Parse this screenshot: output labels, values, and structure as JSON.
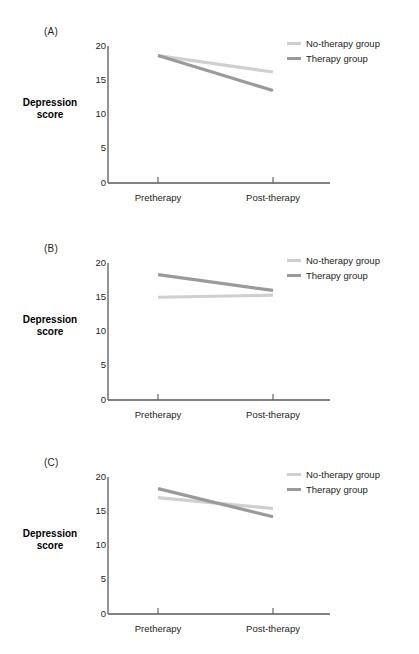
{
  "figure": {
    "series_colors": {
      "no_therapy": "#cfcfcf",
      "therapy": "#9a9a9a"
    },
    "axis_color": "#58595b",
    "panels": [
      {
        "label": "(A)",
        "ylabel_line1": "Depression",
        "ylabel_line2": "score",
        "ytick_labels": [
          "20",
          "15",
          "10",
          "5",
          "0"
        ],
        "xtick_labels": [
          "Pretherapy",
          "Post-therapy"
        ],
        "legend": [
          {
            "name": "no-therapy",
            "label": "No-therapy group"
          },
          {
            "name": "therapy",
            "label": "Therapy group"
          }
        ]
      },
      {
        "label": "(B)",
        "ylabel_line1": "Depression",
        "ylabel_line2": "score",
        "ytick_labels": [
          "20",
          "15",
          "10",
          "5",
          "0"
        ],
        "xtick_labels": [
          "Pretherapy",
          "Post-therapy"
        ],
        "legend": [
          {
            "name": "no-therapy",
            "label": "No-therapy group"
          },
          {
            "name": "therapy",
            "label": "Therapy group"
          }
        ]
      },
      {
        "label": "(C)",
        "ylabel_line1": "Depression",
        "ylabel_line2": "score",
        "ytick_labels": [
          "20",
          "15",
          "10",
          "5",
          "0"
        ],
        "xtick_labels": [
          "Pretherapy",
          "Post-therapy"
        ],
        "legend": [
          {
            "name": "no-therapy",
            "label": "No-therapy group"
          },
          {
            "name": "therapy",
            "label": "Therapy group"
          }
        ]
      }
    ]
  },
  "chart_data": [
    {
      "type": "line",
      "panel": "(A)",
      "title": "",
      "xlabel": "",
      "ylabel": "Depression score",
      "categories": [
        "Pretherapy",
        "Post-therapy"
      ],
      "x": [
        0,
        1
      ],
      "ylim": [
        0,
        20
      ],
      "yticks": [
        0,
        5,
        10,
        15,
        20
      ],
      "grid": false,
      "legend_position": "top-right",
      "series": [
        {
          "name": "No-therapy group",
          "color": "#cfcfcf",
          "values": [
            18.6,
            16.2
          ]
        },
        {
          "name": "Therapy group",
          "color": "#9a9a9a",
          "values": [
            18.6,
            13.5
          ]
        }
      ]
    },
    {
      "type": "line",
      "panel": "(B)",
      "title": "",
      "xlabel": "",
      "ylabel": "Depression score",
      "categories": [
        "Pretherapy",
        "Post-therapy"
      ],
      "x": [
        0,
        1
      ],
      "ylim": [
        0,
        20
      ],
      "yticks": [
        0,
        5,
        10,
        15,
        20
      ],
      "grid": false,
      "legend_position": "top-right",
      "series": [
        {
          "name": "No-therapy group",
          "color": "#cfcfcf",
          "values": [
            15.0,
            15.3
          ]
        },
        {
          "name": "Therapy group",
          "color": "#9a9a9a",
          "values": [
            18.3,
            16.0
          ]
        }
      ]
    },
    {
      "type": "line",
      "panel": "(C)",
      "title": "",
      "xlabel": "",
      "ylabel": "Depression score",
      "categories": [
        "Pretherapy",
        "Post-therapy"
      ],
      "x": [
        0,
        1
      ],
      "ylim": [
        0,
        20
      ],
      "yticks": [
        0,
        5,
        10,
        15,
        20
      ],
      "grid": false,
      "legend_position": "top-right",
      "series": [
        {
          "name": "No-therapy group",
          "color": "#cfcfcf",
          "values": [
            17.0,
            15.4
          ]
        },
        {
          "name": "Therapy group",
          "color": "#9a9a9a",
          "values": [
            18.3,
            14.2
          ]
        }
      ]
    }
  ]
}
